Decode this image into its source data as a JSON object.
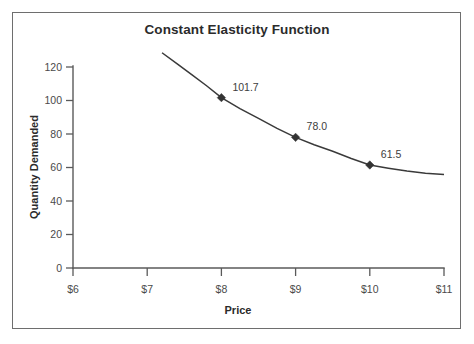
{
  "chart_data": {
    "type": "line",
    "title": "Constant Elasticity Function",
    "xlabel": "Price",
    "ylabel": "Quantity Demanded",
    "xlim": [
      6,
      11
    ],
    "ylim": [
      0,
      130
    ],
    "grid": false,
    "legend": null,
    "x_ticks": [
      6,
      7,
      8,
      9,
      10,
      11
    ],
    "x_tick_labels": [
      "$6",
      "$7",
      "$8",
      "$9",
      "$10",
      "$11"
    ],
    "y_ticks": [
      0,
      20,
      40,
      60,
      80,
      100,
      120
    ],
    "y_tick_labels": [
      "0",
      "20",
      "40",
      "60",
      "80",
      "100",
      "120"
    ],
    "curve_domain": [
      7.2,
      11.0
    ],
    "curve": {
      "x": [
        7.2,
        7.4,
        7.6,
        7.8,
        8.0,
        8.25,
        8.5,
        8.75,
        9.0,
        9.25,
        9.5,
        9.75,
        10.0,
        10.25,
        10.5,
        10.75,
        11.0
      ],
      "y": [
        128.5,
        122.0,
        115.5,
        108.8,
        101.7,
        95.2,
        89.3,
        83.4,
        78.0,
        73.6,
        69.7,
        65.4,
        61.5,
        59.6,
        57.9,
        56.6,
        55.8
      ]
    },
    "points": [
      {
        "x": 8,
        "y": 101.7,
        "label": "101.7"
      },
      {
        "x": 9,
        "y": 78.0,
        "label": "78.0"
      },
      {
        "x": 10,
        "y": 61.5,
        "label": "61.5"
      }
    ],
    "colors": {
      "curve": "#3a3a3a",
      "marker": "#333333",
      "axis": "#5a5a5a",
      "text": "#2b2b2b",
      "frame": "#6e6e6e",
      "background": "#ffffff"
    }
  }
}
